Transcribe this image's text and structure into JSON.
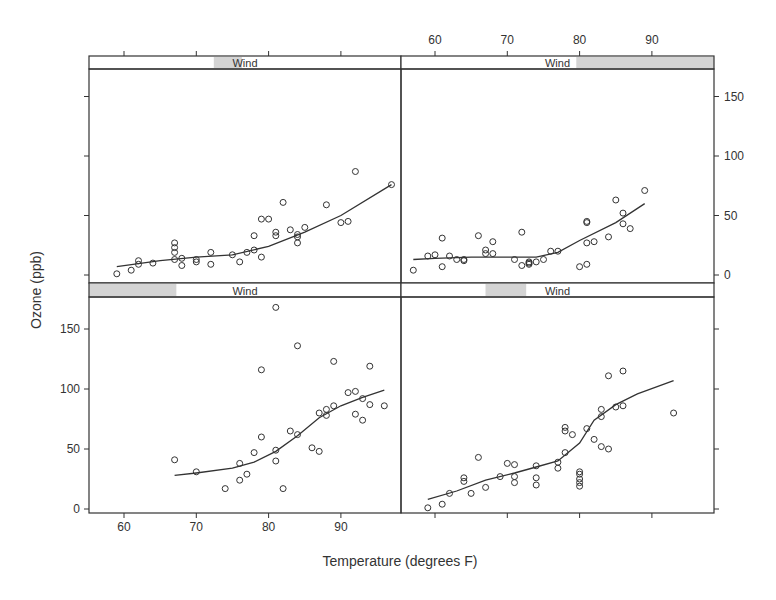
{
  "chart_data": {
    "type": "scatter",
    "title": "",
    "xlabel": "Temperature (degrees F)",
    "ylabel": "Ozone (ppb)",
    "xlim": [
      55,
      99
    ],
    "ylim": [
      -5,
      175
    ],
    "x_ticks": [
      60,
      70,
      80,
      90
    ],
    "y_ticks": [
      0,
      50,
      100,
      150
    ],
    "grid": false,
    "layout": "2x2 conditioning panels (trellis/coplot), strip label 'Wind' with shaded range per panel",
    "panels": [
      {
        "position": "top-left",
        "strip_label": "Wind",
        "strip_shade_fraction": [
          0.4,
          0.49
        ],
        "points": [
          [
            59,
            1
          ],
          [
            61,
            4
          ],
          [
            62,
            12
          ],
          [
            62,
            9
          ],
          [
            64,
            10
          ],
          [
            67,
            27
          ],
          [
            67,
            23
          ],
          [
            67,
            19
          ],
          [
            67,
            13
          ],
          [
            68,
            14
          ],
          [
            68,
            8
          ],
          [
            70,
            11
          ],
          [
            70,
            13
          ],
          [
            72,
            9
          ],
          [
            72,
            19
          ],
          [
            75,
            17
          ],
          [
            76,
            11
          ],
          [
            77,
            19
          ],
          [
            78,
            33
          ],
          [
            78,
            21
          ],
          [
            79,
            47
          ],
          [
            79,
            15
          ],
          [
            80,
            47
          ],
          [
            81,
            33
          ],
          [
            81,
            36
          ],
          [
            82,
            61
          ],
          [
            83,
            38
          ],
          [
            84,
            27
          ],
          [
            84,
            32
          ],
          [
            84,
            34
          ],
          [
            85,
            40
          ],
          [
            88,
            59
          ],
          [
            90,
            44
          ],
          [
            91,
            45
          ],
          [
            92,
            87
          ],
          [
            97,
            76
          ]
        ],
        "smooth": [
          [
            59,
            7
          ],
          [
            65,
            12
          ],
          [
            70,
            15
          ],
          [
            75,
            17
          ],
          [
            80,
            24
          ],
          [
            85,
            36
          ],
          [
            90,
            50
          ],
          [
            97,
            76
          ]
        ]
      },
      {
        "position": "top-right",
        "strip_label": "Wind",
        "strip_shade_fraction": [
          0.56,
          1.0
        ],
        "points": [
          [
            57,
            4
          ],
          [
            59,
            16
          ],
          [
            60,
            17
          ],
          [
            61,
            7
          ],
          [
            61,
            31
          ],
          [
            62,
            16
          ],
          [
            63,
            13
          ],
          [
            64,
            13
          ],
          [
            64,
            12
          ],
          [
            66,
            33
          ],
          [
            67,
            18
          ],
          [
            67,
            21
          ],
          [
            68,
            28
          ],
          [
            68,
            18
          ],
          [
            71,
            13
          ],
          [
            72,
            36
          ],
          [
            72,
            8
          ],
          [
            73,
            11
          ],
          [
            73,
            9
          ],
          [
            73,
            10
          ],
          [
            74,
            11
          ],
          [
            75,
            13
          ],
          [
            76,
            20
          ],
          [
            77,
            20
          ],
          [
            80,
            7
          ],
          [
            81,
            9
          ],
          [
            81,
            27
          ],
          [
            81,
            44
          ],
          [
            81,
            45
          ],
          [
            82,
            28
          ],
          [
            84,
            32
          ],
          [
            85,
            63
          ],
          [
            86,
            52
          ],
          [
            86,
            43
          ],
          [
            87,
            39
          ],
          [
            89,
            71
          ]
        ],
        "smooth": [
          [
            57,
            13
          ],
          [
            60,
            14
          ],
          [
            65,
            15
          ],
          [
            70,
            15
          ],
          [
            74,
            15
          ],
          [
            77,
            19
          ],
          [
            80,
            29
          ],
          [
            85,
            44
          ],
          [
            89,
            60
          ]
        ]
      },
      {
        "position": "bottom-left",
        "strip_label": "Wind",
        "strip_shade_fraction": [
          0.0,
          0.28
        ],
        "points": [
          [
            67,
            41
          ],
          [
            70,
            31
          ],
          [
            74,
            17
          ],
          [
            76,
            24
          ],
          [
            76,
            38
          ],
          [
            77,
            29
          ],
          [
            78,
            47
          ],
          [
            79,
            60
          ],
          [
            79,
            116
          ],
          [
            81,
            168
          ],
          [
            81,
            49
          ],
          [
            81,
            40
          ],
          [
            82,
            17
          ],
          [
            83,
            65
          ],
          [
            84,
            62
          ],
          [
            84,
            136
          ],
          [
            86,
            51
          ],
          [
            87,
            48
          ],
          [
            87,
            80
          ],
          [
            88,
            83
          ],
          [
            88,
            78
          ],
          [
            89,
            86
          ],
          [
            89,
            123
          ],
          [
            91,
            97
          ],
          [
            92,
            98
          ],
          [
            92,
            79
          ],
          [
            93,
            74
          ],
          [
            93,
            92
          ],
          [
            94,
            87
          ],
          [
            94,
            119
          ],
          [
            96,
            86
          ]
        ],
        "smooth": [
          [
            67,
            28
          ],
          [
            70,
            30
          ],
          [
            75,
            34
          ],
          [
            78,
            39
          ],
          [
            81,
            48
          ],
          [
            84,
            61
          ],
          [
            87,
            76
          ],
          [
            90,
            86
          ],
          [
            93,
            93
          ],
          [
            96,
            99
          ]
        ]
      },
      {
        "position": "bottom-right",
        "strip_label": "Wind",
        "strip_shade_fraction": [
          0.27,
          0.4
        ],
        "points": [
          [
            59,
            1
          ],
          [
            61,
            4
          ],
          [
            62,
            13
          ],
          [
            64,
            23
          ],
          [
            64,
            26
          ],
          [
            65,
            13
          ],
          [
            66,
            43
          ],
          [
            67,
            18
          ],
          [
            69,
            27
          ],
          [
            70,
            38
          ],
          [
            71,
            22
          ],
          [
            71,
            27
          ],
          [
            71,
            37
          ],
          [
            74,
            36
          ],
          [
            74,
            26
          ],
          [
            74,
            20
          ],
          [
            77,
            39
          ],
          [
            77,
            34
          ],
          [
            78,
            47
          ],
          [
            78,
            68
          ],
          [
            78,
            65
          ],
          [
            79,
            62
          ],
          [
            80,
            31
          ],
          [
            80,
            29
          ],
          [
            80,
            25
          ],
          [
            80,
            22
          ],
          [
            80,
            19
          ],
          [
            81,
            67
          ],
          [
            82,
            58
          ],
          [
            83,
            52
          ],
          [
            83,
            83
          ],
          [
            83,
            77
          ],
          [
            84,
            50
          ],
          [
            84,
            111
          ],
          [
            85,
            85
          ],
          [
            86,
            86
          ],
          [
            86,
            115
          ],
          [
            93,
            80
          ]
        ],
        "smooth": [
          [
            59,
            8
          ],
          [
            63,
            15
          ],
          [
            67,
            24
          ],
          [
            71,
            30
          ],
          [
            74,
            35
          ],
          [
            77,
            40
          ],
          [
            80,
            55
          ],
          [
            82,
            74
          ],
          [
            85,
            87
          ],
          [
            88,
            96
          ],
          [
            93,
            107
          ]
        ]
      }
    ]
  },
  "axes": {
    "x_ticks_labels": [
      "60",
      "70",
      "80",
      "90"
    ],
    "y_ticks_labels": [
      "0",
      "50",
      "100",
      "150"
    ],
    "x_label": "Temperature (degrees F)",
    "y_label": "Ozone (ppb)"
  },
  "strips": {
    "label": "Wind"
  },
  "colors": {
    "ink": "#333333",
    "strip_shade": "#d4d4d4",
    "background": "#ffffff"
  }
}
